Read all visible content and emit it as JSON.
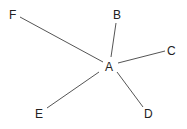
{
  "diagram": {
    "type": "star-graph",
    "center": {
      "label": "A",
      "x": 110,
      "y": 66
    },
    "nodes": [
      {
        "label": "A",
        "x": 110,
        "y": 66
      },
      {
        "label": "B",
        "x": 117,
        "y": 14
      },
      {
        "label": "C",
        "x": 171,
        "y": 50
      },
      {
        "label": "D",
        "x": 148,
        "y": 113
      },
      {
        "label": "E",
        "x": 39,
        "y": 113
      },
      {
        "label": "F",
        "x": 13,
        "y": 14
      }
    ],
    "edges": [
      {
        "from": "A",
        "to": "B",
        "x1": 111,
        "y1": 57,
        "x2": 116,
        "y2": 23
      },
      {
        "from": "A",
        "to": "C",
        "x1": 118,
        "y1": 63,
        "x2": 165,
        "y2": 51
      },
      {
        "from": "A",
        "to": "D",
        "x1": 117,
        "y1": 72,
        "x2": 143,
        "y2": 107
      },
      {
        "from": "A",
        "to": "E",
        "x1": 99,
        "y1": 72,
        "x2": 47,
        "y2": 108
      },
      {
        "from": "A",
        "to": "F",
        "x1": 103,
        "y1": 62,
        "x2": 20,
        "y2": 17
      }
    ]
  }
}
